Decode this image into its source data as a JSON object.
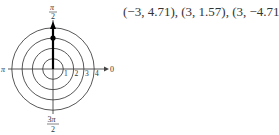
{
  "figure": {
    "type": "polar-plot",
    "angle_labels": {
      "top": "π/2",
      "left": "π",
      "right": "0",
      "bottom": "3π/2"
    },
    "radial_tick_labels": [
      "1",
      "2",
      "3",
      "4"
    ],
    "rings": [
      1,
      2,
      3,
      4
    ],
    "plotted_point": {
      "r": 3,
      "theta_label": "π/2"
    },
    "segment": {
      "from_r": 0,
      "to_r": 4,
      "theta_label": "π/2",
      "arrow": true
    }
  },
  "caption": {
    "points_text": "(−3, 4.71), (3, 1.57), (3, −4.71)"
  }
}
